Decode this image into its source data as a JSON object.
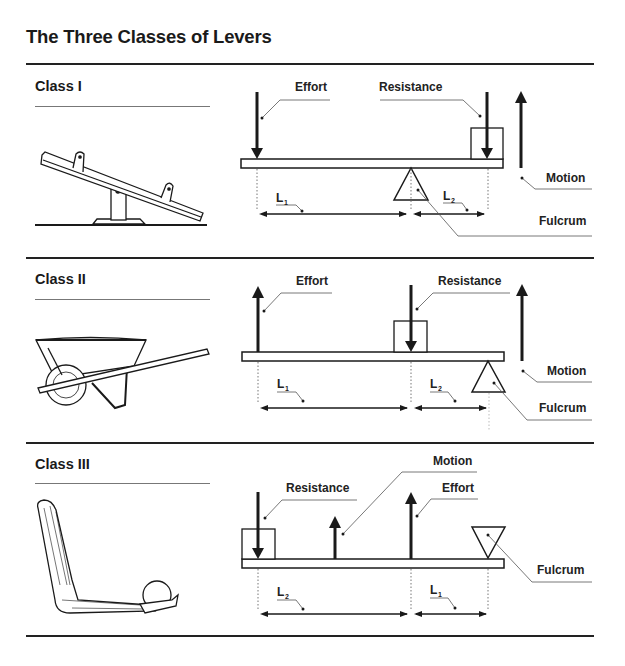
{
  "title": "The Three Classes of Levers",
  "sections": [
    {
      "class_label": "Class I",
      "illustration": "seesaw",
      "labels": {
        "effort": "Effort",
        "resistance": "Resistance",
        "motion": "Motion",
        "fulcrum": "Fulcrum",
        "l1": "L",
        "l1_sub": "1",
        "l2": "L",
        "l2_sub": "2"
      }
    },
    {
      "class_label": "Class II",
      "illustration": "wheelbarrow",
      "labels": {
        "effort": "Effort",
        "resistance": "Resistance",
        "motion": "Motion",
        "fulcrum": "Fulcrum",
        "l1": "L",
        "l1_sub": "1",
        "l2": "L",
        "l2_sub": "2"
      }
    },
    {
      "class_label": "Class III",
      "illustration": "arm-holding-ball",
      "labels": {
        "effort": "Effort",
        "resistance": "Resistance",
        "motion": "Motion",
        "fulcrum": "Fulcrum",
        "l1": "L",
        "l1_sub": "1",
        "l2": "L",
        "l2_sub": "2"
      }
    }
  ],
  "colors": {
    "ink": "#1a1a1a",
    "rule": "#222222",
    "leader": "#555555",
    "background": "#ffffff"
  }
}
